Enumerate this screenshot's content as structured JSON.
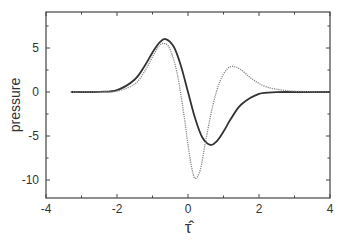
{
  "chart_data": {
    "type": "line",
    "title": "",
    "xlabel": "τ̂",
    "ylabel": "pressure",
    "xlim": [
      -4,
      4
    ],
    "ylim": [
      -12,
      9.3
    ],
    "grid": false,
    "legend": null,
    "xticks": [
      -4,
      -2,
      0,
      2,
      4
    ],
    "yticks": [
      -10,
      -5,
      0,
      5
    ],
    "xtick_labels": [
      "-4",
      "-2",
      "0",
      "2",
      "4"
    ],
    "ytick_labels": [
      "-10",
      "-5",
      "0",
      "5"
    ],
    "series": [
      {
        "name": "solid",
        "style": "solid",
        "x": [
          -3.3,
          -2.5,
          -2.0,
          -1.5,
          -1.2,
          -1.0,
          -0.8,
          -0.63,
          -0.4,
          -0.2,
          0.0,
          0.2,
          0.4,
          0.63,
          0.8,
          1.0,
          1.2,
          1.5,
          2.0,
          2.5,
          3.0,
          4.0
        ],
        "y": [
          0.0,
          0.02,
          0.21,
          1.42,
          3.11,
          4.5,
          5.64,
          6.02,
          5.14,
          2.99,
          0.0,
          -2.99,
          -5.14,
          -6.02,
          -5.64,
          -4.5,
          -3.11,
          -1.42,
          -0.21,
          -0.02,
          0.0,
          0.0
        ]
      },
      {
        "name": "dotted",
        "style": "dotted",
        "x": [
          -3.3,
          -2.5,
          -2.0,
          -1.5,
          -1.2,
          -1.0,
          -0.8,
          -0.65,
          -0.5,
          -0.3,
          -0.1,
          0.0,
          0.1,
          0.2,
          0.35,
          0.5,
          0.7,
          0.9,
          1.1,
          1.27,
          1.5,
          1.8,
          2.2,
          2.8,
          3.5,
          4.0
        ],
        "y": [
          0.0,
          0.02,
          0.1,
          0.9,
          2.5,
          4.0,
          5.3,
          5.5,
          4.8,
          2.0,
          -3.0,
          -6.0,
          -8.5,
          -9.8,
          -8.8,
          -5.5,
          -1.5,
          1.2,
          2.6,
          2.9,
          2.5,
          1.5,
          0.6,
          0.15,
          0.03,
          0.0
        ]
      }
    ]
  }
}
